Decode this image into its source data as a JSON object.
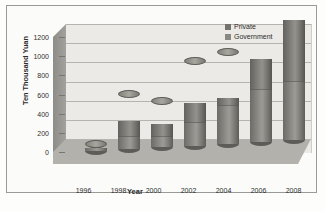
{
  "chart_data": {
    "type": "bar",
    "subtype": "stacked-column-3d-cylinder",
    "title": "",
    "xlabel": "Year",
    "ylabel": "Ten Thousand Yuan",
    "categories": [
      "1996",
      "1998",
      "2000",
      "2002",
      "2004",
      "2006",
      "2008"
    ],
    "series": [
      {
        "name": "Government",
        "values": [
          35,
          130,
          110,
          230,
          390,
          540,
          600
        ]
      },
      {
        "name": "Private",
        "values": [
          0,
          160,
          130,
          210,
          90,
          320,
          650
        ]
      }
    ],
    "totals": [
      35,
      290,
      240,
      440,
      480,
      860,
      1250
    ],
    "ylim": [
      0,
      1200
    ],
    "yticks": [
      0,
      200,
      400,
      600,
      800,
      1000,
      1200
    ],
    "grid": true,
    "legend_position": "top-right",
    "colors": {
      "government": "#8a8883",
      "private": "#74726d",
      "plot_background": "#eceae6",
      "floor": "#b3b1ac",
      "gridline": "#b6b4af",
      "frame": "#9a9a96",
      "text": "#2c2c2c"
    }
  },
  "legend": {
    "items": [
      {
        "label": "Private",
        "color": "#74726d"
      },
      {
        "label": "Government",
        "color": "#8a8883"
      }
    ]
  }
}
